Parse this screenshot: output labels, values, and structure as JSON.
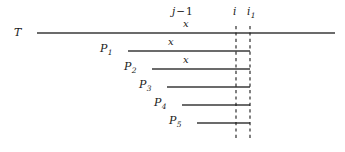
{
  "figure": {
    "width": 345,
    "height": 152,
    "background": "#ffffff",
    "stroke_color": "#3a3a3a",
    "text_color": "#1a1a1a"
  },
  "axis_labels": {
    "j_minus_1": {
      "base": "j",
      "operator": "−",
      "operand": "1",
      "x": 185,
      "y": 6
    },
    "i": {
      "text": "i",
      "x": 236,
      "y": 6
    },
    "i_one": {
      "base": "i",
      "subscript": "1",
      "x": 250,
      "y": 6
    }
  },
  "text_line": {
    "label": "T",
    "label_x": 14,
    "label_y": 27,
    "x_mark": "x",
    "x_mark_x": 183,
    "x_mark_y": 18,
    "start": 37,
    "end": 335,
    "y": 33
  },
  "patterns": [
    {
      "label": "P",
      "subscript": "1",
      "label_x": 100,
      "label_y": 44,
      "start": 128,
      "end": 250,
      "y": 51,
      "x_mark": "x",
      "x_mark_x": 168,
      "x_mark_y": 37
    },
    {
      "label": "P",
      "subscript": "2",
      "label_x": 130,
      "label_y": 62,
      "start": 152,
      "end": 250,
      "y": 69,
      "x_mark": "x",
      "x_mark_x": 183,
      "x_mark_y": 55
    },
    {
      "label": "P",
      "subscript": "3",
      "label_x": 144,
      "label_y": 80,
      "start": 167,
      "end": 250,
      "y": 87,
      "x_mark": "",
      "x_mark_x": 0,
      "x_mark_y": 0
    },
    {
      "label": "P",
      "subscript": "4",
      "label_x": 159,
      "label_y": 98,
      "start": 182,
      "end": 250,
      "y": 105,
      "x_mark": "",
      "x_mark_x": 0,
      "x_mark_y": 0
    },
    {
      "label": "P",
      "subscript": "5",
      "label_x": 174,
      "label_y": 116,
      "start": 197,
      "end": 250,
      "y": 123,
      "x_mark": "",
      "x_mark_x": 0,
      "x_mark_y": 0
    }
  ],
  "dashed_guides": [
    {
      "name": "guide-i",
      "x": 236,
      "y_top": 26,
      "y_bottom": 138
    },
    {
      "name": "guide-i1",
      "x": 250,
      "y_top": 26,
      "y_bottom": 138
    }
  ]
}
